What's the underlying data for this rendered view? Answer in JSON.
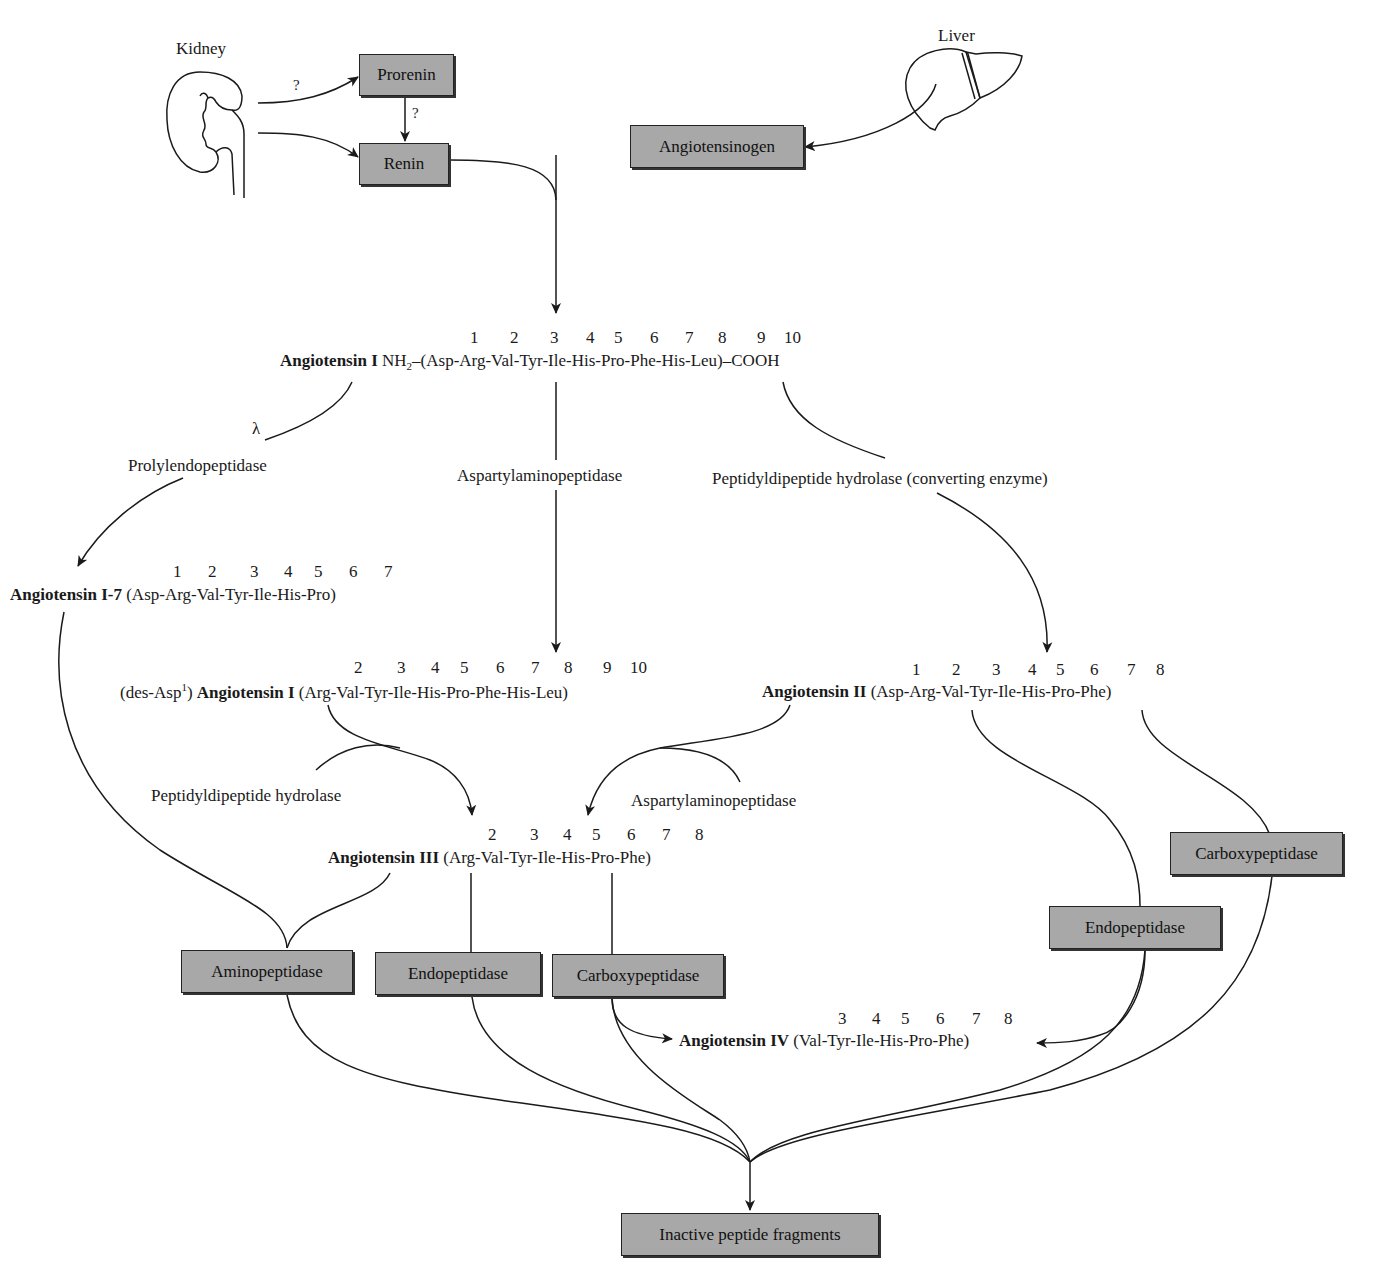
{
  "organs": {
    "kidney": {
      "label": "Kidney",
      "icon": "kidney-icon"
    },
    "liver": {
      "label": "Liver",
      "icon": "liver-icon"
    }
  },
  "boxes": {
    "prorenin": "Prorenin",
    "renin": "Renin",
    "angiotensinogen": "Angiotensinogen",
    "aminopeptidase": "Aminopeptidase",
    "endopeptidase_left": "Endopeptidase",
    "carboxypeptidase_left": "Carboxypeptidase",
    "endopeptidase_right": "Endopeptidase",
    "carboxypeptidase_right": "Carboxypeptidase",
    "inactive": "Inactive peptide fragments"
  },
  "question_marks": [
    "?",
    "?"
  ],
  "lambda": "λ",
  "enzymes": {
    "prolylendopeptidase": "Prolylendopeptidase",
    "aspartylaminopeptidase_top": "Aspartylaminopeptidase",
    "converting_enzyme": "Peptidyldipeptide hydrolase (converting enzyme)",
    "peptidyldipeptide_hydrolase": "Peptidyldipeptide hydrolase",
    "aspartylaminopeptidase_mid": "Aspartylaminopeptidase"
  },
  "peptides": {
    "ang1": {
      "name": "Angiotensin I",
      "prefix": "NH",
      "prefix_sub": "2",
      "sequence": "–(Asp-Arg-Val-Tyr-Ile-His-Pro-Phe-His-Leu)–COOH",
      "positions": [
        "1",
        "2",
        "3",
        "4",
        "5",
        "6",
        "7",
        "8",
        "9",
        "10"
      ]
    },
    "ang1_7": {
      "name": "Angiotensin I-7",
      "sequence": "(Asp-Arg-Val-Tyr-Ile-His-Pro)",
      "positions": [
        "1",
        "2",
        "3",
        "4",
        "5",
        "6",
        "7"
      ]
    },
    "des_asp_ang1": {
      "prefix": "(des-Asp",
      "prefix_sup": "1",
      "prefix_close": ")",
      "name": "Angiotensin I",
      "sequence": "(Arg-Val-Tyr-Ile-His-Pro-Phe-His-Leu)",
      "positions": [
        "2",
        "3",
        "4",
        "5",
        "6",
        "7",
        "8",
        "9",
        "10"
      ]
    },
    "ang2": {
      "name": "Angiotensin II",
      "sequence": "(Asp-Arg-Val-Tyr-Ile-His-Pro-Phe)",
      "positions": [
        "1",
        "2",
        "3",
        "4",
        "5",
        "6",
        "7",
        "8"
      ]
    },
    "ang3": {
      "name": "Angiotensin III",
      "sequence": "(Arg-Val-Tyr-Ile-His-Pro-Phe)",
      "positions": [
        "2",
        "3",
        "4",
        "5",
        "6",
        "7",
        "8"
      ]
    },
    "ang4": {
      "name": "Angiotensin IV",
      "sequence": "(Val-Tyr-Ile-His-Pro-Phe)",
      "positions": [
        "3",
        "4",
        "5",
        "6",
        "7",
        "8"
      ]
    }
  },
  "colors": {
    "box_fill": "#a8a8a8",
    "line": "#1a1a1a",
    "background": "#ffffff"
  }
}
